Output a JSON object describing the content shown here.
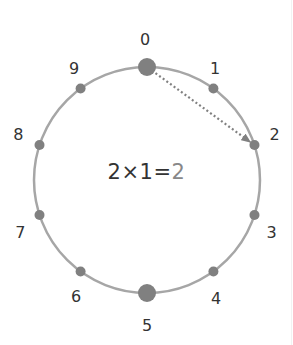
{
  "diagram": {
    "circle": {
      "cx": 147,
      "cy": 180,
      "r": 113,
      "stroke": "#a6a6a6"
    },
    "points": [
      {
        "label": "0",
        "angle_deg": 0,
        "size": "large"
      },
      {
        "label": "1",
        "angle_deg": 36,
        "size": "small"
      },
      {
        "label": "2",
        "angle_deg": 72,
        "size": "small"
      },
      {
        "label": "3",
        "angle_deg": 108,
        "size": "small"
      },
      {
        "label": "4",
        "angle_deg": 144,
        "size": "small"
      },
      {
        "label": "5",
        "angle_deg": 180,
        "size": "large"
      },
      {
        "label": "6",
        "angle_deg": 216,
        "size": "small"
      },
      {
        "label": "7",
        "angle_deg": 252,
        "size": "small"
      },
      {
        "label": "8",
        "angle_deg": 288,
        "size": "small"
      },
      {
        "label": "9",
        "angle_deg": 324,
        "size": "small"
      }
    ],
    "point_color": "#808080",
    "arrow": {
      "from": "0",
      "to": "2",
      "style": "dotted",
      "color": "#808080"
    },
    "equation": {
      "lhs": "2×1=",
      "result": "2",
      "lhs_color": "#333333",
      "result_color": "#888888"
    }
  }
}
